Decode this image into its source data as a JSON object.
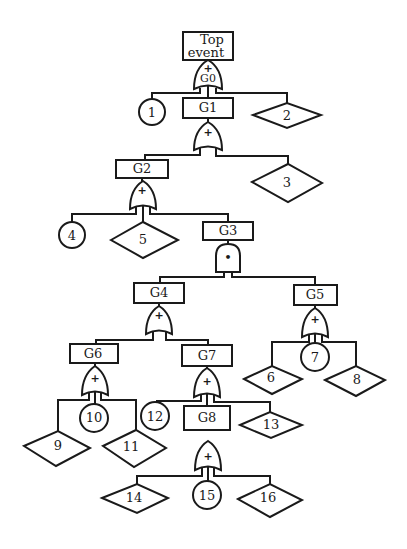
{
  "diagram": {
    "type": "fault-tree",
    "colors": {
      "stroke": "#1a1a1a",
      "background": "#ffffff"
    },
    "top_event": {
      "line1": "Top",
      "line2": "event"
    },
    "gates": {
      "G0": {
        "label": "G0",
        "type": "OR",
        "symbol": "+"
      },
      "G1": {
        "label": "G1",
        "type": "OR",
        "symbol": "+"
      },
      "G2": {
        "label": "G2",
        "type": "OR",
        "symbol": "+"
      },
      "G3": {
        "label": "G3",
        "type": "AND",
        "symbol": "•"
      },
      "G4": {
        "label": "G4",
        "type": "OR",
        "symbol": "+"
      },
      "G5": {
        "label": "G5",
        "type": "OR",
        "symbol": "+"
      },
      "G6": {
        "label": "G6",
        "type": "OR",
        "symbol": "+"
      },
      "G7": {
        "label": "G7",
        "type": "OR",
        "symbol": "+"
      },
      "G8": {
        "label": "G8",
        "type": "OR",
        "symbol": "+"
      }
    },
    "basic_events": {
      "e1": "1",
      "e4": "4",
      "e7": "7",
      "e10": "10",
      "e12": "12",
      "e15": "15"
    },
    "undeveloped_events": {
      "e2": "2",
      "e3": "3",
      "e5": "5",
      "e6": "6",
      "e8": "8",
      "e9": "9",
      "e11": "11",
      "e13": "13",
      "e14": "14",
      "e16": "16"
    },
    "structure": [
      {
        "gate": "G0",
        "inputs": [
          "1",
          "G1",
          "2"
        ]
      },
      {
        "gate": "G1",
        "inputs": [
          "G2",
          "3"
        ]
      },
      {
        "gate": "G2",
        "inputs": [
          "4",
          "5",
          "G3"
        ]
      },
      {
        "gate": "G3",
        "inputs": [
          "G4",
          "G5"
        ]
      },
      {
        "gate": "G4",
        "inputs": [
          "G6",
          "G7"
        ]
      },
      {
        "gate": "G5",
        "inputs": [
          "6",
          "7",
          "8"
        ]
      },
      {
        "gate": "G6",
        "inputs": [
          "9",
          "10",
          "11"
        ]
      },
      {
        "gate": "G7",
        "inputs": [
          "12",
          "G8",
          "13"
        ]
      },
      {
        "gate": "G8",
        "inputs": [
          "14",
          "15",
          "16"
        ]
      }
    ]
  }
}
